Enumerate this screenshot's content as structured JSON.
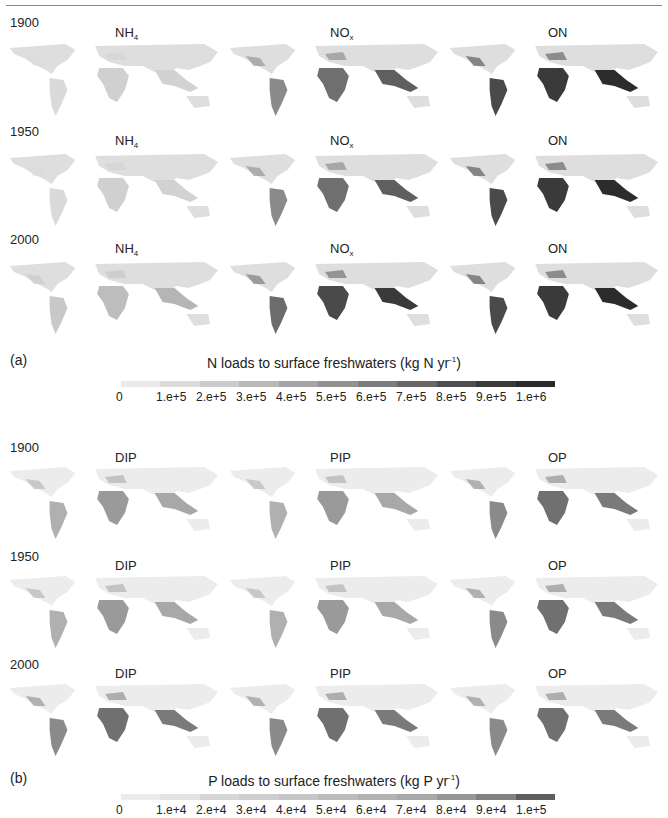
{
  "figure": {
    "panel_a": {
      "label": "(a)",
      "colorbar_title": "N loads to surface freshwaters (kg N yr",
      "colorbar_title_sup": "-1",
      "colorbar_title_end": ")",
      "ticks": [
        "0",
        "1.e+5",
        "2.e+5",
        "3.e+5",
        "4.e+5",
        "5.e+5",
        "6.e+5",
        "7.e+5",
        "8.e+5",
        "9.e+5",
        "1.e+6"
      ],
      "colors": [
        "#e9e9e9",
        "#dcdcdc",
        "#cbcbcb",
        "#b9b9b9",
        "#a5a5a5",
        "#929292",
        "#7d7d7d",
        "#686868",
        "#4f4f4f",
        "#3a3a3a",
        "#2a2a2a"
      ],
      "years": [
        "1900",
        "1950",
        "2000"
      ],
      "variables": [
        {
          "main": "NH",
          "sub": "4"
        },
        {
          "main": "NO",
          "sub": "x"
        },
        {
          "main": "ON",
          "sub": ""
        }
      ]
    },
    "panel_b": {
      "label": "(b)",
      "colorbar_title": "P loads to surface freshwaters (kg P yr",
      "colorbar_title_sup": "-1",
      "colorbar_title_end": ")",
      "ticks": [
        "0",
        "1.e+4",
        "2.e+4",
        "3.e+4",
        "4.e+4",
        "5.e+4",
        "6.e+4",
        "7.e+4",
        "8.e+4",
        "9.e+4",
        "1.e+5"
      ],
      "colors": [
        "#ececec",
        "#e2e2e2",
        "#d6d6d6",
        "#cecece",
        "#c6c6c6",
        "#bcbcbc",
        "#b2b2b2",
        "#a8a8a8",
        "#979797",
        "#818181",
        "#5e5e5e"
      ],
      "years": [
        "1900",
        "1950",
        "2000"
      ],
      "variables": [
        {
          "main": "DIP",
          "sub": ""
        },
        {
          "main": "PIP",
          "sub": ""
        },
        {
          "main": "OP",
          "sub": ""
        }
      ]
    }
  }
}
